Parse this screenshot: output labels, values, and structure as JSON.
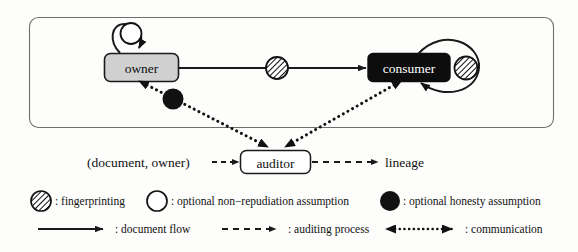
{
  "diagram": {
    "title_present": false,
    "nodes": {
      "owner": {
        "label": "owner",
        "fill": "#d0d0d0",
        "text_color": "#111111"
      },
      "consumer": {
        "label": "consumer",
        "fill": "#0d0d0d",
        "text_color": "#ffffff"
      },
      "auditor": {
        "label": "auditor",
        "fill": "#ffffff",
        "text_color": "#111111"
      }
    },
    "labels": {
      "input_tuple": "(document, owner)",
      "output": "lineage"
    },
    "edges": [
      {
        "name": "owner-to-consumer",
        "type": "document flow",
        "marker": "fingerprinting"
      },
      {
        "name": "owner-self-loop",
        "type": "document flow",
        "marker": "optional non-repudiation assumption"
      },
      {
        "name": "consumer-self-loop",
        "type": "document flow",
        "marker": "fingerprinting"
      },
      {
        "name": "owner-to-auditor",
        "type": "communication",
        "marker": "optional honesty assumption"
      },
      {
        "name": "consumer-to-auditor",
        "type": "communication",
        "marker": "none"
      },
      {
        "name": "tuple-to-auditor",
        "type": "auditing process",
        "marker": "none"
      },
      {
        "name": "auditor-to-lineage",
        "type": "auditing process",
        "marker": "none"
      }
    ]
  },
  "legend": {
    "row1": [
      {
        "icon": "hatched-circle-icon",
        "text": ": fingerprinting"
      },
      {
        "icon": "open-circle-icon",
        "text": ": optional non−repudiation assumption"
      },
      {
        "icon": "filled-circle-icon",
        "text": ": optional honesty assumption"
      }
    ],
    "row2": [
      {
        "icon": "solid-arrow-icon",
        "text": ": document flow"
      },
      {
        "icon": "dashed-arrow-icon",
        "text": ": auditing process"
      },
      {
        "icon": "dotted-double-arrow-icon",
        "text": ": communication"
      }
    ]
  },
  "colors": {
    "ink": "#1a1a1a",
    "frame": "#6e6e6e",
    "owner_fill": "#d0d0d0",
    "consumer_fill": "#0d0d0d",
    "page": "#fdfdfc"
  }
}
